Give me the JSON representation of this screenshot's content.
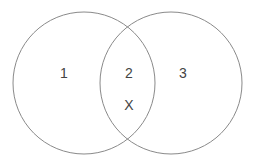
{
  "diagram": {
    "type": "venn",
    "stroke_color": "#8a8a8a",
    "background": "#ffffff",
    "circles": [
      {
        "id": "left",
        "cx": 84,
        "cy": 83,
        "r": 71
      },
      {
        "id": "right",
        "cx": 171,
        "cy": 83,
        "r": 71
      }
    ],
    "labels": [
      {
        "name": "region-1-label",
        "text": "1",
        "x": 64,
        "y": 73
      },
      {
        "name": "region-2-label",
        "text": "2",
        "x": 129,
        "y": 73
      },
      {
        "name": "region-3-label",
        "text": "3",
        "x": 183,
        "y": 73
      },
      {
        "name": "x-marker-label",
        "text": "X",
        "x": 129,
        "y": 105
      }
    ]
  }
}
